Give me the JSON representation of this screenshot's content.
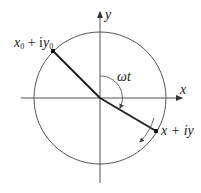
{
  "diagram": {
    "axes": {
      "x_label": "x",
      "y_label": "y"
    },
    "circle": {
      "center": [
        100,
        98
      ],
      "radius": 66
    },
    "start_point": {
      "label_main": "x",
      "label_sub": "0",
      "label_plus": " + i",
      "label_y": "y",
      "label_ysub": "0",
      "full": "x0 + iy0"
    },
    "end_point": {
      "label": "x + iy"
    },
    "angle_label": "ωt",
    "rotation_direction": "clockwise",
    "colors": {
      "line": "#333333",
      "axis": "#555555",
      "circle": "#555555",
      "text": "#222222"
    }
  }
}
